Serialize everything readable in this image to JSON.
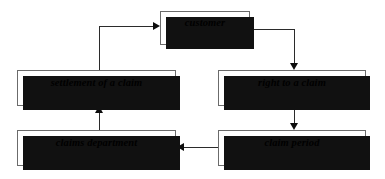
{
  "diagram": {
    "language_note": "English term with Czech translation in parentheses",
    "colors": {
      "node_fill": "#ffffff",
      "node_border": "#6b6b6b",
      "node_shadow": "#111111",
      "edge": "#2b2b2b",
      "arrowhead": "#0d0d0d",
      "text": "#000000",
      "background": "#ffffff"
    },
    "nodes": [
      {
        "id": "customer",
        "en": "customer",
        "cs": "(zákazník)"
      },
      {
        "id": "settlement",
        "en": "settlement of a claim",
        "cs": "(vyřízení reklamace)"
      },
      {
        "id": "right_to_claim",
        "en": "right to a claim",
        "cs": "(nárok na reklamaci)"
      },
      {
        "id": "claims_dept",
        "en": "claims department",
        "cs": "(reklamační oddělení)"
      },
      {
        "id": "claim_period",
        "en": "claim period",
        "cs": "(reklamační lhůta)"
      }
    ],
    "edges": [
      {
        "id": "customer-to-right-to-claim",
        "from": "customer",
        "to": "right_to_claim",
        "direction": "down"
      },
      {
        "id": "right-to-claim-to-claim-period",
        "from": "right_to_claim",
        "to": "claim_period",
        "direction": "down"
      },
      {
        "id": "claim-period-to-claims-dept",
        "from": "claim_period",
        "to": "claims_dept",
        "direction": "left"
      },
      {
        "id": "claims-dept-to-settlement",
        "from": "claims_dept",
        "to": "settlement",
        "direction": "up"
      },
      {
        "id": "settlement-to-customer",
        "from": "settlement",
        "to": "customer",
        "direction": "right"
      }
    ]
  }
}
